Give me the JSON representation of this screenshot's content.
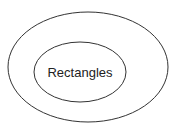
{
  "diagram": {
    "type": "nested-sets",
    "outer_set": {
      "label": ""
    },
    "inner_set": {
      "label": "Rectangles"
    },
    "colors": {
      "stroke": "#333333",
      "fill": "#ffffff",
      "text": "#222222"
    }
  }
}
